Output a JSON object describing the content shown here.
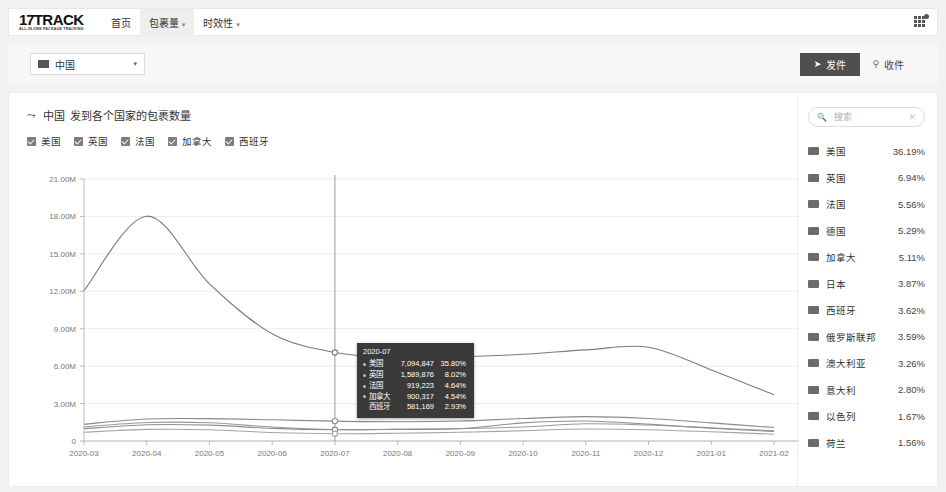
{
  "nav": {
    "brand_main": "17TRACK",
    "brand_num": "17",
    "brand_word": "TRACK",
    "brand_sub": "ALL-IN-ONE PACKAGE TRACKING",
    "items": [
      {
        "label": "首页",
        "active": false,
        "has_caret": false
      },
      {
        "label": "包裹量",
        "active": true,
        "has_caret": true
      },
      {
        "label": "时效性",
        "active": false,
        "has_caret": true
      }
    ],
    "apps_icon": "grid-apps-icon"
  },
  "filter": {
    "country_value": "中国",
    "country_flag": "cn-flag-icon",
    "send_label": "发件",
    "send_icon": "send-arrow-icon",
    "receive_label": "收件",
    "receive_icon": "location-pin-icon"
  },
  "chart_card": {
    "title_country": "中国",
    "title_rest": "发到各个国家的包裹数量",
    "trend_icon": "trend-line-icon",
    "legend": [
      {
        "label": "美国",
        "checked": true
      },
      {
        "label": "英国",
        "checked": true
      },
      {
        "label": "法国",
        "checked": true
      },
      {
        "label": "加拿大",
        "checked": true
      },
      {
        "label": "西班牙",
        "checked": true
      }
    ]
  },
  "tooltip": {
    "date": "2020-07",
    "rows": [
      {
        "name": "美国",
        "value": "7,094,847",
        "pct": "35.80%",
        "dot": true
      },
      {
        "name": "英国",
        "value": "1,589,876",
        "pct": "8.02%",
        "dot": true
      },
      {
        "name": "法国",
        "value": "919,223",
        "pct": "4.64%",
        "dot": true
      },
      {
        "name": "加拿大",
        "value": "900,317",
        "pct": "4.54%",
        "dot": true
      },
      {
        "name": "西班牙",
        "value": "581,169",
        "pct": "2.93%",
        "dot": false
      }
    ]
  },
  "sidebar": {
    "search_placeholder": "搜索",
    "search_value": "",
    "search_icon": "search-icon",
    "clear_icon": "close-icon",
    "rows": [
      {
        "name": "美国",
        "pct": "36.19%"
      },
      {
        "name": "英国",
        "pct": "6.94%"
      },
      {
        "name": "法国",
        "pct": "5.56%"
      },
      {
        "name": "德国",
        "pct": "5.29%"
      },
      {
        "name": "加拿大",
        "pct": "5.11%"
      },
      {
        "name": "日本",
        "pct": "3.87%"
      },
      {
        "name": "西班牙",
        "pct": "3.62%"
      },
      {
        "name": "俄罗斯联邦",
        "pct": "3.59%"
      },
      {
        "name": "澳大利亚",
        "pct": "3.26%"
      },
      {
        "name": "意大利",
        "pct": "2.80%"
      },
      {
        "name": "以色列",
        "pct": "1.67%"
      },
      {
        "name": "荷兰",
        "pct": "1.56%"
      }
    ]
  },
  "chart_data": {
    "type": "line",
    "title": "中国 发到各个国家的包裹数量",
    "xlabel": "",
    "ylabel": "",
    "ylim": [
      0,
      21000000
    ],
    "yticks": [
      0,
      3000000,
      6000000,
      9000000,
      12000000,
      15000000,
      18000000,
      21000000
    ],
    "ytick_labels": [
      "0",
      "3.00M",
      "6.00M",
      "9.00M",
      "12.00M",
      "15.00M",
      "18.00M",
      "21.00M"
    ],
    "grid": true,
    "legend_position": "top-left",
    "highlight_x": "2020-07",
    "categories": [
      "2020-03",
      "2020-04",
      "2020-05",
      "2020-06",
      "2020-07",
      "2020-08",
      "2020-09",
      "2020-10",
      "2020-11",
      "2020-12",
      "2021-01",
      "2021-02"
    ],
    "series": [
      {
        "name": "美国",
        "color": "#7b7b7b",
        "values": [
          12050000,
          18020000,
          12600000,
          8600000,
          7094847,
          6700000,
          6750000,
          6950000,
          7300000,
          7520000,
          5700000,
          3700000
        ]
      },
      {
        "name": "英国",
        "color": "#8a8a8a",
        "values": [
          1350000,
          1760000,
          1790000,
          1700000,
          1589876,
          1540000,
          1600000,
          1800000,
          1950000,
          1800000,
          1450000,
          1080000
        ]
      },
      {
        "name": "法国",
        "color": "#999999",
        "values": [
          1120000,
          1480000,
          1460000,
          1120000,
          919223,
          940000,
          1000000,
          1120000,
          1380000,
          1280000,
          1050000,
          820000
        ]
      },
      {
        "name": "加拿大",
        "color": "#8f8f8f",
        "values": [
          980000,
          1300000,
          1270000,
          1010000,
          900317,
          930000,
          980000,
          1450000,
          1600000,
          1350000,
          1020000,
          760000
        ]
      },
      {
        "name": "西班牙",
        "color": "#a5a5a5",
        "values": [
          700000,
          930000,
          900000,
          680000,
          581169,
          620000,
          700000,
          820000,
          960000,
          900000,
          740000,
          540000
        ]
      }
    ]
  }
}
